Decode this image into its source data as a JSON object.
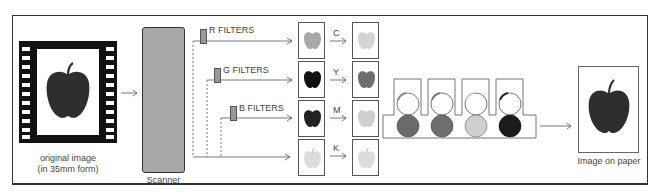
{
  "diagram": {
    "original": {
      "label_line1": "original image",
      "label_line2": "(in 35mm form)"
    },
    "scanner": {
      "label": "Scanner",
      "color": "#a8a8a8"
    },
    "filters": [
      {
        "label": "R FILTERS",
        "separation_color": "#a8a8a8",
        "ink_letter": "C",
        "ink_color": "#d4d4d4"
      },
      {
        "label": "G FILTERS",
        "separation_color": "#1a1a1a",
        "ink_letter": "Y",
        "ink_color": "#6e6e6e"
      },
      {
        "label": "B FILTERS",
        "separation_color": "#2a2a2a",
        "ink_letter": "M",
        "ink_color": "#cfcfcf"
      },
      {
        "label": "",
        "separation_color": "#dcdcdc",
        "ink_letter": "K",
        "ink_color": "#dcdcdc"
      }
    ],
    "print_units": [
      {
        "roller_color": "#6a6a6a"
      },
      {
        "roller_color": "#6e6e6e"
      },
      {
        "roller_color": "#cfcfcf"
      },
      {
        "roller_color": "#1c1c1c"
      }
    ],
    "output": {
      "label": "Image on paper",
      "apple_color": "#2e2e2e"
    },
    "colors": {
      "border": "#333333",
      "apple_dark": "#2e2e2e",
      "filter_rect": "#999999"
    }
  }
}
